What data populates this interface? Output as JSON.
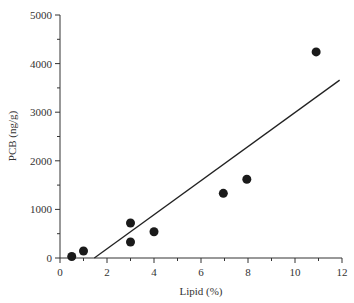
{
  "chart_data": {
    "type": "scatter",
    "title": "",
    "xlabel": "Lipid (%)",
    "ylabel": "PCB (ng/g)",
    "xlim": [
      0,
      12
    ],
    "ylim": [
      0,
      5000
    ],
    "x_ticks": [
      0,
      2,
      4,
      6,
      8,
      10,
      12
    ],
    "y_ticks": [
      0,
      1000,
      2000,
      3000,
      4000,
      5000
    ],
    "grid": false,
    "legend": null,
    "series": [
      {
        "name": "samples",
        "points": [
          {
            "x": 0.5,
            "y": 30
          },
          {
            "x": 1.0,
            "y": 145
          },
          {
            "x": 3.0,
            "y": 330
          },
          {
            "x": 3.0,
            "y": 720
          },
          {
            "x": 4.0,
            "y": 540
          },
          {
            "x": 6.95,
            "y": 1330
          },
          {
            "x": 7.95,
            "y": 1620
          },
          {
            "x": 10.9,
            "y": 4240
          }
        ]
      }
    ],
    "regression_line": {
      "x1": 1.46,
      "y1": 0,
      "x2": 11.9,
      "y2": 3660
    }
  }
}
